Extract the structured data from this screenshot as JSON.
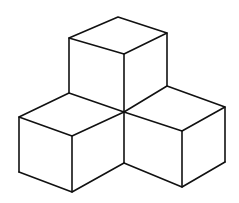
{
  "diagram": {
    "type": "isometric-cube-arrangement",
    "cube_count": 3,
    "stroke_color": "#111111",
    "background_color": "#ffffff",
    "cubes": [
      {
        "name": "top-cube",
        "top_face": [
          [
            118,
            17
          ],
          [
            167,
            33
          ],
          [
            124,
            54
          ],
          [
            69,
            38
          ]
        ],
        "verticals": [
          [
            [
              69,
              38
            ],
            [
              69,
              93
            ]
          ],
          [
            [
              124,
              54
            ],
            [
              124,
              112
            ]
          ],
          [
            [
              167,
              33
            ],
            [
              167,
              86
            ]
          ]
        ]
      },
      {
        "name": "left-cube",
        "top_face": [
          [
            69,
            93
          ],
          [
            124,
            112
          ],
          [
            72,
            136
          ],
          [
            19,
            117
          ]
        ],
        "verticals": [
          [
            [
              19,
              117
            ],
            [
              19,
              172
            ]
          ],
          [
            [
              72,
              136
            ],
            [
              72,
              192
            ]
          ],
          [
            [
              124,
              112
            ],
            [
              124,
              163
            ]
          ]
        ],
        "bottom": [
          [
            19,
            172
          ],
          [
            72,
            192
          ],
          [
            124,
            163
          ]
        ]
      },
      {
        "name": "right-cube",
        "top_face": [
          [
            167,
            86
          ],
          [
            225,
            107
          ],
          [
            182,
            131
          ],
          [
            124,
            112
          ]
        ],
        "verticals": [
          [
            [
              225,
              107
            ],
            [
              225,
              162
            ]
          ],
          [
            [
              182,
              131
            ],
            [
              182,
              187
            ]
          ]
        ],
        "bottom": [
          [
            124,
            163
          ],
          [
            182,
            187
          ],
          [
            225,
            162
          ]
        ]
      }
    ]
  }
}
